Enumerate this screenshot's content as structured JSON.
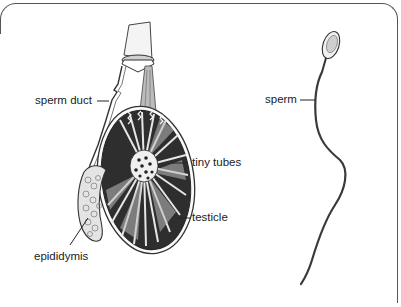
{
  "diagram": {
    "title": "",
    "labels": {
      "sperm_duct": "sperm duct",
      "tiny_tubes": "tiny tubes",
      "testicle": "testicle",
      "epididymis": "epididymis",
      "sperm": "sperm"
    },
    "colors": {
      "ink": "#222222",
      "tissue_dark": "#3a3a3a",
      "tissue_light": "#d8d8d8",
      "frame": "#555555"
    }
  }
}
